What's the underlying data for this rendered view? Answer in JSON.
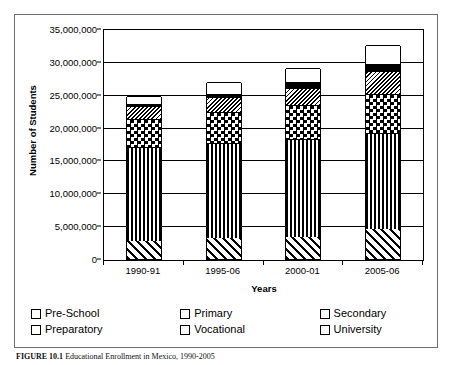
{
  "figure": {
    "caption_label": "FIGURE 10.1",
    "caption_text": "Educational Enrollment in Mexico, 1990-2005"
  },
  "chart_data": {
    "type": "bar",
    "stacked": true,
    "title": "",
    "xlabel": "Years",
    "ylabel": "Number of Students",
    "categories": [
      "1990-91",
      "1995-06",
      "2000-01",
      "2005-06"
    ],
    "ylim": [
      0,
      35000000
    ],
    "ytick_values": [
      0,
      5000000,
      10000000,
      15000000,
      20000000,
      25000000,
      30000000,
      35000000
    ],
    "ytick_labels": [
      "0",
      "5,000,000",
      "10,000,000",
      "15,000,000",
      "20,000,000",
      "25,000,000",
      "30,000,000",
      "35,000,000"
    ],
    "grid": true,
    "grid_axis": "y",
    "legend_position": "bottom",
    "series": [
      {
        "name": "Pre-School",
        "pattern": "diagonal-stripe-forward",
        "values": [
          2700000,
          3200000,
          3400000,
          4500000
        ]
      },
      {
        "name": "Primary",
        "pattern": "vertical-stripe",
        "values": [
          14400000,
          14500000,
          14800000,
          14700000
        ]
      },
      {
        "name": "Secondary",
        "pattern": "checkerboard",
        "values": [
          4200000,
          4700000,
          5300000,
          5900000
        ]
      },
      {
        "name": "Preparatory",
        "pattern": "fine-diagonal-hatch",
        "values": [
          2000000,
          2300000,
          2600000,
          3500000
        ]
      },
      {
        "name": "Vocational",
        "pattern": "solid-black",
        "values": [
          300000,
          400000,
          900000,
          1100000
        ]
      },
      {
        "name": "University",
        "pattern": "white-open",
        "values": [
          1200000,
          1900000,
          2100000,
          2800000
        ]
      }
    ],
    "totals": [
      24800000,
      27000000,
      29100000,
      32500000
    ]
  },
  "legend": {
    "columns": [
      {
        "entries": [
          {
            "label": "Pre-School",
            "swatch": "diagonal-stripe-forward-swatch"
          },
          {
            "label": "Preparatory",
            "swatch": "fine-diagonal-hatch-swatch"
          }
        ]
      },
      {
        "entries": [
          {
            "label": "Primary",
            "swatch": "vertical-stripe-swatch"
          },
          {
            "label": "Vocational",
            "swatch": "solid-black-swatch"
          }
        ]
      },
      {
        "entries": [
          {
            "label": "Secondary",
            "swatch": "checkerboard-swatch"
          },
          {
            "label": "University",
            "swatch": "white-open-swatch"
          }
        ]
      }
    ]
  },
  "colors": {
    "axis": "#000000",
    "grid": "#000000",
    "frame": "#6d6d6d",
    "background": "#ffffff",
    "fill_dark": "#000000",
    "fill_light": "#ffffff"
  }
}
